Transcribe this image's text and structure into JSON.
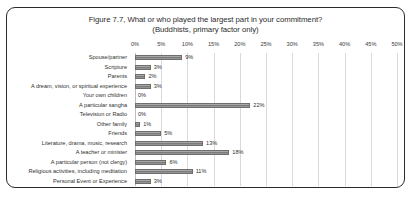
{
  "chart_data": {
    "type": "bar",
    "orientation": "horizontal",
    "title": "Figure 7.7, What or who played the largest part in your commitment?",
    "subtitle": "(Buddhists, primary factor only)",
    "xlabel": "",
    "ylabel": "",
    "xlim": [
      0,
      50
    ],
    "grid": true,
    "legend": "none",
    "tick_labels": [
      "0%",
      "5%",
      "10%",
      "15%",
      "20%",
      "25%",
      "30%",
      "35%",
      "40%",
      "45%",
      "50%"
    ],
    "tick_values": [
      0,
      5,
      10,
      15,
      20,
      25,
      30,
      35,
      40,
      45,
      50
    ],
    "categories": [
      "Spouse/partner",
      "Scripture",
      "Parents",
      "A dream, vision, or spiritual experience",
      "Your own children",
      "A particular sangha",
      "Television or Radio",
      "Other family",
      "Friends",
      "Literature, drama, music, research",
      "A teacher or minister",
      "A particular person (not clergy)",
      "Religious activities, including meditation",
      "Personal Event or Experience"
    ],
    "values": [
      9,
      3,
      2,
      3,
      0,
      22,
      0,
      1,
      5,
      13,
      18,
      6,
      11,
      3
    ],
    "data_labels": [
      "9%",
      "3%",
      "2%",
      "3%",
      "0%",
      "22%",
      "0%",
      "1%",
      "5%",
      "13%",
      "18%",
      "6%",
      "11%",
      "3%"
    ],
    "colors": {
      "bar_fill": "#8e8e8e",
      "bar_border": "#6e6e6e",
      "gridline": "#d9d9d9",
      "text": "#2f2f2f",
      "frame_border": "#2b2b2b",
      "background": "#ffffff"
    }
  }
}
